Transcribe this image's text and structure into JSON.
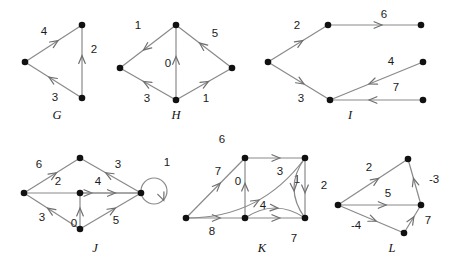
{
  "figure": {
    "width": 455,
    "height": 269,
    "background": "#ffffff",
    "edge_color": "#8a8a8a",
    "node_color": "#111111",
    "label_color": "#1a1a1a"
  },
  "graphs": [
    {
      "id": "G",
      "name": "G",
      "name_pos": [
        57,
        116
      ],
      "nodes": [
        {
          "id": "g0",
          "x": 25,
          "y": 62
        },
        {
          "id": "g1",
          "x": 82,
          "y": 25
        },
        {
          "id": "g2",
          "x": 82,
          "y": 98
        }
      ],
      "edges": [
        {
          "from": "g0",
          "to": "g1",
          "weight": "4",
          "label_pos": [
            44,
            32
          ]
        },
        {
          "from": "g2",
          "to": "g1",
          "weight": "2",
          "label_pos": [
            94,
            50
          ]
        },
        {
          "from": "g2",
          "to": "g0",
          "weight": "3",
          "label_pos": [
            55,
            98
          ]
        }
      ]
    },
    {
      "id": "H",
      "name": "H",
      "name_pos": [
        176,
        116
      ],
      "nodes": [
        {
          "id": "h_top",
          "x": 176,
          "y": 25
        },
        {
          "id": "h_left",
          "x": 120,
          "y": 68
        },
        {
          "id": "h_right",
          "x": 232,
          "y": 68
        },
        {
          "id": "h_bot",
          "x": 176,
          "y": 100
        }
      ],
      "edges": [
        {
          "from": "h_top",
          "to": "h_left",
          "weight": "1",
          "label_pos": [
            138,
            26
          ]
        },
        {
          "from": "h_right",
          "to": "h_top",
          "weight": "5",
          "label_pos": [
            215,
            34
          ]
        },
        {
          "from": "h_bot",
          "to": "h_top",
          "weight": "0",
          "label_pos": [
            168,
            64
          ]
        },
        {
          "from": "h_bot",
          "to": "h_left",
          "weight": "3",
          "label_pos": [
            147,
            99
          ]
        },
        {
          "from": "h_bot",
          "to": "h_right",
          "weight": "1",
          "label_pos": [
            206,
            99
          ]
        }
      ]
    },
    {
      "id": "I",
      "name": "I",
      "name_pos": [
        350,
        116
      ],
      "nodes": [
        {
          "id": "i_left",
          "x": 268,
          "y": 62
        },
        {
          "id": "i_um",
          "x": 328,
          "y": 25
        },
        {
          "id": "i_ur",
          "x": 421,
          "y": 25
        },
        {
          "id": "i_lm",
          "x": 330,
          "y": 100
        },
        {
          "id": "i_mr",
          "x": 423,
          "y": 62
        },
        {
          "id": "i_lr",
          "x": 423,
          "y": 100
        }
      ],
      "edges": [
        {
          "from": "i_left",
          "to": "i_um",
          "weight": "2",
          "label_pos": [
            297,
            26
          ]
        },
        {
          "from": "i_um",
          "to": "i_ur",
          "weight": "6",
          "label_pos": [
            384,
            15
          ]
        },
        {
          "from": "i_left",
          "to": "i_lm",
          "weight": "3",
          "label_pos": [
            301,
            99
          ]
        },
        {
          "from": "i_mr",
          "to": "i_lm",
          "weight": "4",
          "label_pos": [
            391,
            62
          ]
        },
        {
          "from": "i_lr",
          "to": "i_lm",
          "weight": "7",
          "label_pos": [
            396,
            88
          ]
        }
      ]
    },
    {
      "id": "J",
      "name": "J",
      "name_pos": [
        95,
        249
      ],
      "nodes": [
        {
          "id": "j_left",
          "x": 24,
          "y": 193
        },
        {
          "id": "j_top",
          "x": 80,
          "y": 158
        },
        {
          "id": "j_ctr",
          "x": 80,
          "y": 193
        },
        {
          "id": "j_bot",
          "x": 80,
          "y": 229
        },
        {
          "id": "j_right",
          "x": 141,
          "y": 193
        }
      ],
      "edges": [
        {
          "from": "j_left",
          "to": "j_top",
          "weight": "6",
          "label_pos": [
            39,
            165
          ]
        },
        {
          "from": "j_right",
          "to": "j_top",
          "weight": "3",
          "label_pos": [
            118,
            165
          ]
        },
        {
          "from": "j_left",
          "to": "j_right",
          "weight": "2",
          "label_pos": [
            58,
            182
          ]
        },
        {
          "from": "j_ctr",
          "to": "j_right",
          "weight": "4",
          "label_pos": [
            98,
            182
          ]
        },
        {
          "from": "j_bot",
          "to": "j_left",
          "weight": "3",
          "label_pos": [
            42,
            218
          ]
        },
        {
          "from": "j_bot",
          "to": "j_ctr",
          "weight": "0",
          "label_pos": [
            74,
            224
          ]
        },
        {
          "from": "j_bot",
          "to": "j_right",
          "weight": "5",
          "label_pos": [
            116,
            221
          ]
        },
        {
          "from": "j_right",
          "to": "j_right",
          "weight": "1",
          "label_pos": [
            167,
            163
          ],
          "self_loop": true
        }
      ]
    },
    {
      "id": "K",
      "name": "K",
      "name_pos": [
        262,
        249
      ],
      "nodes": [
        {
          "id": "k_left",
          "x": 186,
          "y": 218
        },
        {
          "id": "k_tl",
          "x": 245,
          "y": 158
        },
        {
          "id": "k_tr",
          "x": 305,
          "y": 158
        },
        {
          "id": "k_bm",
          "x": 245,
          "y": 218
        },
        {
          "id": "k_br",
          "x": 305,
          "y": 218
        }
      ],
      "edges": [
        {
          "from": "k_left",
          "to": "k_tr",
          "weight": "6",
          "label_pos": [
            222,
            140
          ],
          "curved": true
        },
        {
          "from": "k_left",
          "to": "k_tl",
          "weight": "7",
          "label_pos": [
            218,
            172
          ]
        },
        {
          "from": "k_bm",
          "to": "k_tl",
          "weight": "0",
          "label_pos": [
            238,
            182
          ]
        },
        {
          "from": "k_tl",
          "to": "k_tr",
          "weight": "3",
          "label_pos": [
            280,
            172
          ]
        },
        {
          "from": "k_tr",
          "to": "k_br",
          "weight": "1",
          "label_pos": [
            297,
            180
          ]
        },
        {
          "from": "k_tr",
          "to": "k_br",
          "weight": "2",
          "label_pos": [
            324,
            186
          ],
          "curved": true
        },
        {
          "from": "k_left",
          "to": "k_bm",
          "weight": "8",
          "label_pos": [
            212,
            232
          ]
        },
        {
          "from": "k_bm",
          "to": "k_br",
          "weight": "4",
          "label_pos": [
            263,
            206
          ]
        },
        {
          "from": "k_bm",
          "to": "k_br",
          "weight": "7",
          "label_pos": [
            294,
            239
          ],
          "curved": true
        }
      ]
    },
    {
      "id": "L",
      "name": "L",
      "name_pos": [
        392,
        249
      ],
      "nodes": [
        {
          "id": "l_left",
          "x": 338,
          "y": 205
        },
        {
          "id": "l_top",
          "x": 408,
          "y": 159
        },
        {
          "id": "l_right",
          "x": 421,
          "y": 205
        },
        {
          "id": "l_bot",
          "x": 404,
          "y": 233
        }
      ],
      "edges": [
        {
          "from": "l_left",
          "to": "l_top",
          "weight": "2",
          "label_pos": [
            369,
            168
          ]
        },
        {
          "from": "l_right",
          "to": "l_top",
          "weight": "-3",
          "label_pos": [
            434,
            180
          ]
        },
        {
          "from": "l_left",
          "to": "l_right",
          "weight": "5",
          "label_pos": [
            388,
            194
          ]
        },
        {
          "from": "l_left",
          "to": "l_bot",
          "weight": "-4",
          "label_pos": [
            356,
            226
          ]
        },
        {
          "from": "l_bot",
          "to": "l_right",
          "weight": "7",
          "label_pos": [
            428,
            221
          ]
        }
      ]
    }
  ]
}
